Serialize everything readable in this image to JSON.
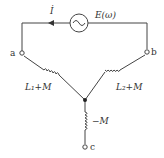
{
  "diagram": {
    "type": "circuit",
    "source": {
      "label": "E(ω)",
      "symbol": "~"
    },
    "current": {
      "label": "İ",
      "direction": "right-to-left"
    },
    "terminals": {
      "a": "a",
      "b": "b",
      "c": "c"
    },
    "inductors": {
      "left": "L₁+M",
      "right": "L₂+M",
      "bottom": "−M"
    },
    "colors": {
      "wire": "#444444",
      "text": "#333333"
    }
  }
}
